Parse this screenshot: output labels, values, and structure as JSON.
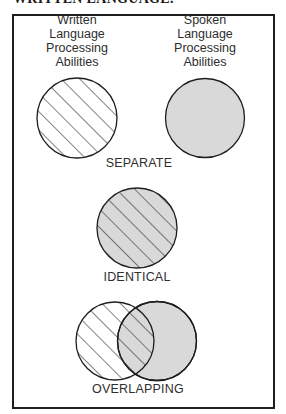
{
  "header": {
    "text": "WRITTEN LANGUAGE."
  },
  "labels": {
    "written": [
      "Written",
      "Language",
      "Processing",
      "Abilities"
    ],
    "spoken": [
      "Spoken",
      "Language",
      "Processing",
      "Abilities"
    ]
  },
  "captions": {
    "separate": "SEPARATE",
    "identical": "IDENTICAL",
    "overlapping": "OVERLAPPING"
  },
  "legend": {
    "written_pattern": "diagonal-hatch",
    "spoken_fill": "#d9d9d9"
  },
  "colors": {
    "stroke": "#1e1e1e",
    "gray_fill": "#d9d9d9",
    "text": "#2e2e2e"
  }
}
